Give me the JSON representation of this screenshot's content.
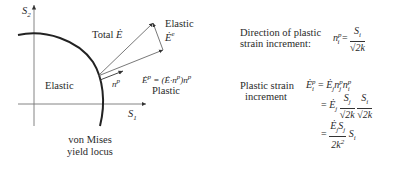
{
  "diagram": {
    "axes": {
      "x_label": "S",
      "x_sub": "1",
      "y_label": "S",
      "y_sub": "2"
    },
    "regions": {
      "elastic_inside": "Elastic",
      "yield_locus_line1": "von Mises",
      "yield_locus_line2": "yield locus"
    },
    "vectors": {
      "total_label": "Total",
      "total_symbol": "Ė",
      "elastic_label": "Elastic",
      "elastic_symbol": "Ė",
      "elastic_sup": "e",
      "normal_symbol": "n",
      "normal_sup": "p",
      "plastic_eq": "Ė",
      "plastic_eq_sup": "p",
      "plastic_eq_rhs": "= (Ė·n",
      "plastic_eq_rhs_sup": "p",
      "plastic_eq_rhs_end": ")n",
      "plastic_eq_rhs_end_sup": "p",
      "plastic_label": "Plastic"
    }
  },
  "equations": {
    "direction_label_line1": "Direction of plastic",
    "direction_label_line2": "strain increment:",
    "direction_lhs": "n",
    "direction_lhs_sub": "i",
    "direction_lhs_sup": "p",
    "direction_num": "S",
    "direction_num_sub": "i",
    "direction_den": "√2k",
    "increment_label_line1": "Plastic strain",
    "increment_label_line2": "increment",
    "line1": "Ė",
    "line1_text": "Ė_i^p = Ė_j n_j^p n_i^p",
    "line2_text": "= Ė_j (S_j/√2k)(S_i/√2k)",
    "line3_text": "= (Ė_j S_j / 2k²) S_i"
  },
  "colors": {
    "ink": "#2a2a2a",
    "axis": "#666666",
    "background": "#ffffff"
  }
}
